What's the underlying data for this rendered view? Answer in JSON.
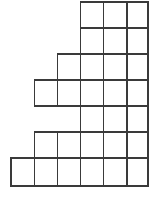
{
  "figure": {
    "cell_fill": "#ffffff",
    "cell_stroke": "#3a3a3a",
    "stroke_width": 1.3,
    "background": "#ffffff"
  },
  "chart_data": {
    "type": "bar",
    "title": "",
    "xlabel": "",
    "ylabel": "",
    "categories": [
      "1",
      "2",
      "3",
      "4",
      "5",
      "6"
    ],
    "values": [
      1,
      3,
      4,
      5,
      7,
      7
    ],
    "ylim": [
      0,
      7
    ],
    "grid": true,
    "legend": false,
    "note": "Unit-square blocks stacked per column; column 5 and 6 have a gap row",
    "column_stacks": [
      {
        "column": 1,
        "filled_rows": [
          6
        ]
      },
      {
        "column": 2,
        "filled_rows": [
          3,
          5,
          6
        ]
      },
      {
        "column": 3,
        "filled_rows": [
          2,
          3,
          5,
          6
        ]
      },
      {
        "column": 4,
        "filled_rows": [
          0,
          1,
          2,
          3,
          4,
          5,
          6
        ]
      },
      {
        "column": 5,
        "filled_rows": [
          0,
          1,
          2,
          3,
          4,
          5,
          6
        ]
      },
      {
        "column": 6,
        "filled_rows": [
          0,
          1,
          2,
          3,
          4,
          5,
          6
        ]
      }
    ]
  },
  "geometry": {
    "column_edges": [
      11,
      34.2,
      57.4,
      80.6,
      103.8,
      127,
      148
    ],
    "row_edges": [
      2,
      28,
      54,
      80,
      106,
      132,
      158,
      186
    ],
    "rows": [
      {
        "index": 0,
        "filled_columns": [
          3,
          4,
          5
        ]
      },
      {
        "index": 1,
        "filled_columns": [
          3,
          4,
          5
        ]
      },
      {
        "index": 2,
        "filled_columns": [
          2,
          3,
          4,
          5
        ]
      },
      {
        "index": 3,
        "filled_columns": [
          1,
          2,
          3,
          4,
          5
        ]
      },
      {
        "index": 4,
        "filled_columns": [
          3,
          4,
          5
        ]
      },
      {
        "index": 5,
        "filled_columns": [
          1,
          2,
          3,
          4,
          5
        ]
      },
      {
        "index": 6,
        "filled_columns": [
          0,
          1,
          2,
          3,
          4,
          5
        ]
      }
    ]
  }
}
